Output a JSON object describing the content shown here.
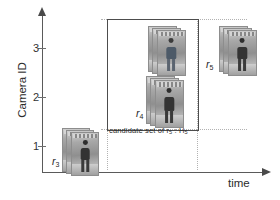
{
  "diagram": {
    "axes": {
      "y_title": "Camera ID",
      "x_title": "time",
      "y_ticks": [
        "3",
        "2",
        "1"
      ]
    },
    "candidate_box": {
      "caption_text": "candidate set of r",
      "caption_sub1": "5",
      "caption_mid": " : H",
      "caption_sub2": "5"
    },
    "tracklets": [
      {
        "id": "r3",
        "label_main": "r",
        "label_sub": "3",
        "camera": 1,
        "cards": 3
      },
      {
        "id": "r4",
        "label_main": "r",
        "label_sub": "4",
        "camera": 2,
        "cards": 3
      },
      {
        "id": "r5",
        "label_main": "r",
        "label_sub": "5",
        "camera": 3,
        "cards": 3
      }
    ],
    "colors": {
      "axis": "#5a5a5a",
      "box_border": "#4d4d4d",
      "guide": "#b2b2b2",
      "text": "#2b2b2b"
    }
  }
}
